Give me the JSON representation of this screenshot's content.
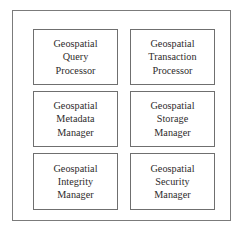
{
  "diagram": {
    "type": "block-diagram",
    "title": "",
    "background_color": "#ffffff",
    "frame": {
      "name": "outer-container",
      "border_color": "#7b7b7b"
    },
    "layout": {
      "columns": 2,
      "rows": 3
    },
    "box_border_color": "#6f6f6f",
    "text_color": "#2e2b2b",
    "components": [
      {
        "id": "geospatial-query-processor",
        "lines": [
          "Geospatial",
          "Query",
          "Processor"
        ],
        "row": 1,
        "column": 1
      },
      {
        "id": "geospatial-transaction-processor",
        "lines": [
          "Geospatial",
          "Transaction",
          "Processor"
        ],
        "row": 1,
        "column": 2
      },
      {
        "id": "geospatial-metadata-manager",
        "lines": [
          "Geospatial",
          "Metadata",
          "Manager"
        ],
        "row": 2,
        "column": 1
      },
      {
        "id": "geospatial-storage-manager",
        "lines": [
          "Geospatial",
          "Storage",
          "Manager"
        ],
        "row": 2,
        "column": 2
      },
      {
        "id": "geospatial-integrity-manager",
        "lines": [
          "Geospatial",
          "Integrity",
          "Manager"
        ],
        "row": 3,
        "column": 1
      },
      {
        "id": "geospatial-security-manager",
        "lines": [
          "Geospatial",
          "Security",
          "Manager"
        ],
        "row": 3,
        "column": 2
      }
    ]
  }
}
